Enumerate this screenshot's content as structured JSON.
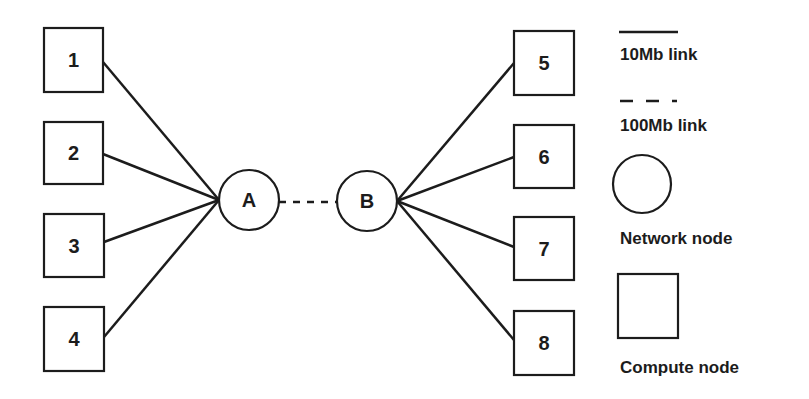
{
  "diagram": {
    "type": "network-topology",
    "stroke_color": "#1c1c1c",
    "background": "#ffffff",
    "compute_nodes": [
      {
        "id": "1",
        "label": "1",
        "x": 44,
        "y": 28,
        "w": 59,
        "h": 64
      },
      {
        "id": "2",
        "label": "2",
        "x": 44,
        "y": 122,
        "w": 59,
        "h": 62
      },
      {
        "id": "3",
        "label": "3",
        "x": 44,
        "y": 214,
        "w": 60,
        "h": 63
      },
      {
        "id": "4",
        "label": "4",
        "x": 44,
        "y": 307,
        "w": 60,
        "h": 64
      },
      {
        "id": "5",
        "label": "5",
        "x": 514,
        "y": 31,
        "w": 60,
        "h": 64
      },
      {
        "id": "6",
        "label": "6",
        "x": 514,
        "y": 125,
        "w": 60,
        "h": 63
      },
      {
        "id": "7",
        "label": "7",
        "x": 514,
        "y": 217,
        "w": 60,
        "h": 63
      },
      {
        "id": "8",
        "label": "8",
        "x": 514,
        "y": 311,
        "w": 60,
        "h": 64
      }
    ],
    "network_nodes": [
      {
        "id": "A",
        "label": "A",
        "cx": 249,
        "cy": 200,
        "r": 30
      },
      {
        "id": "B",
        "label": "B",
        "cx": 367,
        "cy": 201,
        "r": 30
      }
    ],
    "links": [
      {
        "from": "1",
        "to": "A",
        "type": "10Mb",
        "x1": 103,
        "y1": 62,
        "x2": 219,
        "y2": 200
      },
      {
        "from": "2",
        "to": "A",
        "type": "10Mb",
        "x1": 103,
        "y1": 154,
        "x2": 219,
        "y2": 200
      },
      {
        "from": "3",
        "to": "A",
        "type": "10Mb",
        "x1": 104,
        "y1": 242,
        "x2": 219,
        "y2": 200
      },
      {
        "from": "4",
        "to": "A",
        "type": "10Mb",
        "x1": 104,
        "y1": 337,
        "x2": 219,
        "y2": 200
      },
      {
        "from": "A",
        "to": "B",
        "type": "100Mb",
        "x1": 279,
        "y1": 202,
        "x2": 337,
        "y2": 202
      },
      {
        "from": "B",
        "to": "5",
        "type": "10Mb",
        "x1": 397,
        "y1": 201,
        "x2": 514,
        "y2": 63
      },
      {
        "from": "B",
        "to": "6",
        "type": "10Mb",
        "x1": 397,
        "y1": 201,
        "x2": 514,
        "y2": 157
      },
      {
        "from": "B",
        "to": "7",
        "type": "10Mb",
        "x1": 397,
        "y1": 201,
        "x2": 514,
        "y2": 247
      },
      {
        "from": "B",
        "to": "8",
        "type": "10Mb",
        "x1": 397,
        "y1": 201,
        "x2": 514,
        "y2": 340
      }
    ]
  },
  "legend": {
    "solid_line_label": "10Mb link",
    "dashed_line_label": "100Mb link",
    "circle_label": "Network node",
    "square_label": "Compute node"
  }
}
